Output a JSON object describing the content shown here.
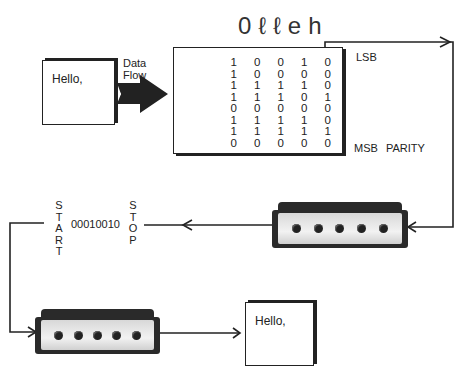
{
  "diagram": {
    "title_word": "0ℓℓeh",
    "sender_doc": {
      "text": "Hello,"
    },
    "receiver_doc": {
      "text": "Hello,"
    },
    "data_flow_label": {
      "line1": "Data",
      "line2": "Flow"
    },
    "matrix": {
      "rows": [
        [
          "1",
          "0",
          "0",
          "1",
          "0"
        ],
        [
          "1",
          "0",
          "0",
          "0",
          "0"
        ],
        [
          "1",
          "1",
          "1",
          "1",
          "0"
        ],
        [
          "1",
          "1",
          "1",
          "0",
          "1"
        ],
        [
          "0",
          "0",
          "0",
          "0",
          "0"
        ],
        [
          "1",
          "1",
          "1",
          "1",
          "0"
        ],
        [
          "1",
          "1",
          "1",
          "1",
          "1"
        ],
        [
          "0",
          "0",
          "0",
          "0",
          "0"
        ]
      ],
      "lsb_label": "LSB",
      "msb_label": "MSB",
      "parity_label": "PARITY"
    },
    "serial_frame": {
      "start_letters": [
        "S",
        "T",
        "A",
        "R",
        "T"
      ],
      "bits": "00010010",
      "stop_letters": [
        "S",
        "T",
        "O",
        "P"
      ]
    },
    "modems": [
      {
        "id": "modem-1",
        "leds": 5
      },
      {
        "id": "modem-2",
        "leds": 5
      }
    ],
    "colors": {
      "ink": "#222222",
      "background": "#ffffff",
      "modem_face": "#e6e6e6"
    }
  }
}
